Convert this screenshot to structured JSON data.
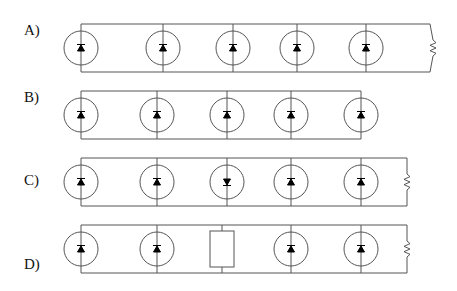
{
  "diagram": {
    "type": "circuit-options",
    "stroke_color": "#555555",
    "diode_color": "#000000",
    "options": [
      {
        "label": "A)",
        "label_pos": [
          24,
          32
        ],
        "top_y": 24,
        "bottom_y": 72,
        "left_x": 81,
        "right_x": 430,
        "right_terminal": "resistor",
        "resistor_bent": true,
        "elements": [
          {
            "x": 81,
            "kind": "led",
            "dir": "up"
          },
          {
            "x": 163,
            "kind": "led",
            "dir": "up"
          },
          {
            "x": 233,
            "kind": "led",
            "dir": "up"
          },
          {
            "x": 297,
            "kind": "led",
            "dir": "up"
          },
          {
            "x": 366,
            "kind": "led",
            "dir": "up"
          }
        ]
      },
      {
        "label": "B)",
        "label_pos": [
          24,
          99
        ],
        "top_y": 91,
        "bottom_y": 139,
        "left_x": 81,
        "right_x": 361,
        "right_terminal": "none",
        "elements": [
          {
            "x": 81,
            "kind": "led",
            "dir": "up"
          },
          {
            "x": 157,
            "kind": "led",
            "dir": "up"
          },
          {
            "x": 227,
            "kind": "led",
            "dir": "up"
          },
          {
            "x": 291,
            "kind": "led",
            "dir": "up"
          },
          {
            "x": 361,
            "kind": "led",
            "dir": "up"
          }
        ]
      },
      {
        "label": "C)",
        "label_pos": [
          24,
          182
        ],
        "top_y": 158,
        "bottom_y": 206,
        "left_x": 81,
        "right_x": 407,
        "right_terminal": "resistor",
        "elements": [
          {
            "x": 81,
            "kind": "led",
            "dir": "up"
          },
          {
            "x": 157,
            "kind": "led",
            "dir": "up"
          },
          {
            "x": 227,
            "kind": "led",
            "dir": "down"
          },
          {
            "x": 291,
            "kind": "led",
            "dir": "up"
          },
          {
            "x": 361,
            "kind": "led",
            "dir": "up"
          }
        ]
      },
      {
        "label": "D)",
        "label_pos": [
          24,
          266
        ],
        "top_y": 225,
        "bottom_y": 273,
        "left_x": 81,
        "right_x": 407,
        "right_terminal": "resistor",
        "elements": [
          {
            "x": 81,
            "kind": "led",
            "dir": "up"
          },
          {
            "x": 157,
            "kind": "led",
            "dir": "up"
          },
          {
            "x": 222,
            "kind": "box"
          },
          {
            "x": 291,
            "kind": "led",
            "dir": "up"
          },
          {
            "x": 361,
            "kind": "led",
            "dir": "up"
          }
        ]
      }
    ]
  }
}
